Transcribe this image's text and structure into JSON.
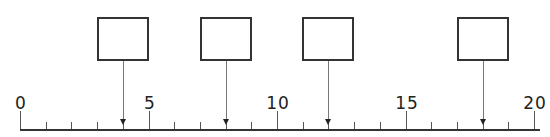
{
  "number_line": {
    "min": 0,
    "max": 20,
    "minor_step": 1,
    "major_step": 5,
    "labels": [
      {
        "value": 0,
        "text": "0"
      },
      {
        "value": 5,
        "text": "5"
      },
      {
        "value": 10,
        "text": "10"
      },
      {
        "value": 15,
        "text": "15"
      },
      {
        "value": 20,
        "text": "20"
      }
    ]
  },
  "answer_boxes": [
    {
      "points_to": 4,
      "text": ""
    },
    {
      "points_to": 8,
      "text": ""
    },
    {
      "points_to": 12,
      "text": ""
    },
    {
      "points_to": 18,
      "text": ""
    }
  ],
  "colors": {
    "line": "#333333",
    "pointer": "#777777",
    "text": "#222222"
  }
}
